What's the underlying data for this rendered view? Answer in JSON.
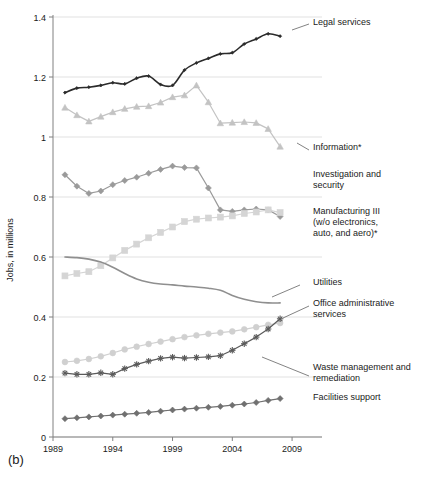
{
  "panel": {
    "label": "(b)"
  },
  "chart_data": {
    "type": "line",
    "title": "",
    "xlabel": "",
    "ylabel": "Jobs, in millions",
    "xlim": [
      1989,
      2010.5
    ],
    "ylim": [
      0,
      1.4
    ],
    "yticks": [
      "0",
      "0.2",
      "0.4",
      "0.6",
      "0.8",
      "1",
      "1.2",
      "1.4"
    ],
    "ytick_values": [
      0,
      0.2,
      0.4,
      0.6,
      0.8,
      1.0,
      1.2,
      1.4
    ],
    "xticks": [
      "1989",
      "1994",
      "1999",
      "2004",
      "2009"
    ],
    "xtick_values": [
      1989,
      1994,
      1999,
      2004,
      2009
    ],
    "grid": true,
    "legend_position": "right-inline-annotations",
    "x": [
      1990,
      1991,
      1992,
      1993,
      1994,
      1995,
      1996,
      1997,
      1998,
      1999,
      2000,
      2001,
      2002,
      2003,
      2004,
      2005,
      2006,
      2007,
      2008
    ],
    "series": [
      {
        "name": "Legal services",
        "label": "Legal services",
        "color": "#2b2b2b",
        "marker": "diamond-small",
        "values": [
          1.148,
          1.163,
          1.166,
          1.172,
          1.181,
          1.177,
          1.196,
          1.203,
          1.175,
          1.172,
          1.223,
          1.247,
          1.262,
          1.277,
          1.281,
          1.31,
          1.327,
          1.344,
          1.336
        ],
        "label_x": 313,
        "label_y": 25
      },
      {
        "name": "Information",
        "label": "Information*",
        "color": "#c3c3c3",
        "marker": "triangle",
        "values": [
          1.098,
          1.073,
          1.052,
          1.068,
          1.083,
          1.094,
          1.101,
          1.103,
          1.115,
          1.133,
          1.139,
          1.172,
          1.116,
          1.046,
          1.048,
          1.05,
          1.047,
          1.027,
          0.968
        ],
        "label_x": 313,
        "label_y": 150
      },
      {
        "name": "Investigation and security",
        "label": "Investigation and security",
        "color": "#9a9a9a",
        "marker": "diamond",
        "values": [
          0.874,
          0.836,
          0.812,
          0.82,
          0.841,
          0.855,
          0.866,
          0.879,
          0.892,
          0.903,
          0.898,
          0.897,
          0.83,
          0.757,
          0.752,
          0.757,
          0.76,
          0.757,
          0.735
        ],
        "label_x": 313,
        "label_y": 177
      },
      {
        "name": "Manufacturing III (w/o electronics, auto, and aero)",
        "label": "Manufacturing III (w/o electronics, auto, and aero)*",
        "color": "#d5d5d5",
        "marker": "square",
        "values": [
          0.537,
          0.545,
          0.551,
          0.571,
          0.597,
          0.622,
          0.643,
          0.664,
          0.682,
          0.7,
          0.718,
          0.726,
          0.73,
          0.733,
          0.737,
          0.745,
          0.75,
          0.757,
          0.748
        ],
        "label_x": 313,
        "label_y": 214
      },
      {
        "name": "Utilities",
        "label": "Utilities",
        "color": "#8f8f8f",
        "marker": "none",
        "values": [
          0.6,
          0.598,
          0.593,
          0.583,
          0.566,
          0.545,
          0.527,
          0.516,
          0.51,
          0.507,
          0.503,
          0.5,
          0.496,
          0.489,
          0.472,
          0.459,
          0.451,
          0.447,
          0.447
        ],
        "label_x": 313,
        "label_y": 285
      },
      {
        "name": "Office administrative services",
        "label": "Office administrative services",
        "color": "#d0d0d0",
        "marker": "circle",
        "values": [
          0.25,
          0.254,
          0.26,
          0.269,
          0.28,
          0.292,
          0.301,
          0.31,
          0.318,
          0.326,
          0.333,
          0.339,
          0.344,
          0.348,
          0.352,
          0.359,
          0.366,
          0.374,
          0.38
        ],
        "label_x": 313,
        "label_y": 306
      },
      {
        "name": "Waste management and remediation",
        "label": "Waste management and remediation",
        "color": "#5a5a5a",
        "marker": "star",
        "values": [
          0.213,
          0.209,
          0.209,
          0.214,
          0.209,
          0.228,
          0.242,
          0.253,
          0.262,
          0.266,
          0.263,
          0.265,
          0.267,
          0.271,
          0.289,
          0.311,
          0.333,
          0.36,
          0.394
        ],
        "label_x": 313,
        "label_y": 370
      },
      {
        "name": "Facilities support",
        "label": "Facilities support",
        "color": "#707070",
        "marker": "diamond",
        "values": [
          0.061,
          0.064,
          0.067,
          0.07,
          0.073,
          0.076,
          0.079,
          0.082,
          0.086,
          0.09,
          0.093,
          0.096,
          0.099,
          0.102,
          0.106,
          0.11,
          0.115,
          0.122,
          0.128
        ],
        "label_x": 313,
        "label_y": 400
      }
    ],
    "annotation_lines": [
      {
        "name": "legal-services-leader",
        "x1": 292,
        "y1": 30,
        "x2": 309,
        "y2": 24
      },
      {
        "name": "information-leader",
        "x1": 297,
        "y1": 143,
        "x2": 309,
        "y2": 150
      },
      {
        "name": "utilities-leader",
        "x1": 272,
        "y1": 297,
        "x2": 300,
        "y2": 285
      },
      {
        "name": "office-admin-leader",
        "x1": 283,
        "y1": 318,
        "x2": 309,
        "y2": 306
      },
      {
        "name": "waste-management-leader",
        "x1": 262,
        "y1": 357,
        "x2": 309,
        "y2": 376
      }
    ]
  }
}
